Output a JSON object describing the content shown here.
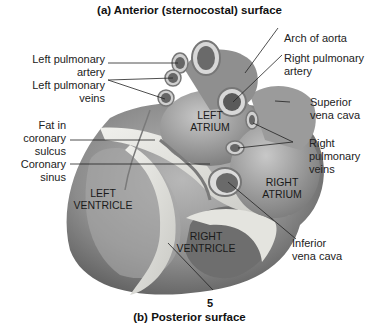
{
  "titles": {
    "top": "(a) Anterior (sternocostal) surface",
    "bottom": "(b) Posterior surface"
  },
  "figure_number": "5",
  "left_labels": [
    {
      "id": "left-pulmonary-artery",
      "line1": "Left pulmonary",
      "line2": "artery"
    },
    {
      "id": "left-pulmonary-veins",
      "line1": "Left pulmonary",
      "line2": "veins"
    },
    {
      "id": "fat-in-coronary-sulcus",
      "line1": "Fat in",
      "line2": "coronary",
      "line3": "sulcus"
    },
    {
      "id": "coronary-sinus",
      "line1": "Coronary",
      "line2": "sinus"
    }
  ],
  "right_labels": [
    {
      "id": "arch-of-aorta",
      "line1": "Arch of aorta"
    },
    {
      "id": "right-pulmonary-artery",
      "line1": "Right pulmonary",
      "line2": "artery"
    },
    {
      "id": "superior-vena-cava",
      "line1": "Superior",
      "line2": "vena cava"
    },
    {
      "id": "right-pulmonary-veins",
      "line1": "Right",
      "line2": "pulmonary",
      "line3": "veins"
    },
    {
      "id": "inferior-vena-cava",
      "line1": "Inferior",
      "line2": "vena cava"
    }
  ],
  "regions": {
    "left_atrium": {
      "line1": "LEFT",
      "line2": "ATRIUM"
    },
    "left_ventricle": {
      "line1": "LEFT",
      "line2": "VENTRICLE"
    },
    "right_atrium": {
      "line1": "RIGHT",
      "line2": "ATRIUM"
    },
    "right_ventricle": {
      "line1": "RIGHT",
      "line2": "VENTRICLE"
    }
  },
  "colors": {
    "heart_dark": "#5a5a5a",
    "heart_mid": "#9a9a9a",
    "heart_light": "#d4d4d4",
    "fat": "#e6e6e2",
    "text": "#222222"
  }
}
